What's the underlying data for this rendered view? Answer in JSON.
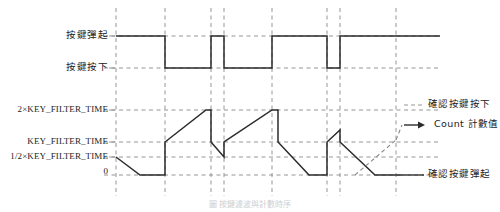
{
  "figure": {
    "caption": "圖 按鍵濾波與計數時序",
    "colors": {
      "waveform": "#2b2b2b",
      "gridline": "#8a8a8a",
      "reference_line": "#8a8a8a",
      "projection_line": "#8a8a8a",
      "background": "#ffffff",
      "text": "#1b1b1b"
    }
  },
  "left_labels": {
    "signal": [
      {
        "id": "key-release",
        "text": "按鍵彈起",
        "y": 36
      },
      {
        "id": "key-press",
        "text": "按鍵按下",
        "y": 68
      }
    ],
    "count_axis": [
      {
        "id": "two-x-key-filter-time",
        "text": "2×KEY_FILTER_TIME",
        "y": 110
      },
      {
        "id": "key-filter-time",
        "text": "KEY_FILTER_TIME",
        "y": 142
      },
      {
        "id": "half-key-filter-time",
        "text": "1/2×KEY_FILTER_TIME",
        "y": 157
      },
      {
        "id": "zero",
        "text": "0",
        "y": 172
      }
    ]
  },
  "right_labels": [
    {
      "id": "confirm-key-press",
      "text": "確認按鍵按下",
      "y": 105
    },
    {
      "id": "count-value",
      "text": "Count 計數值",
      "y": 125,
      "arrow": true
    },
    {
      "id": "confirm-key-release",
      "text": "確認按鍵彈起",
      "y": 175
    }
  ],
  "chart_data": {
    "type": "line",
    "xlabel": "",
    "ylabel": "",
    "grid": true,
    "legend_position": "right",
    "plot_area": {
      "x0": 116,
      "x1": 440,
      "y_top": 8,
      "y_bottom": 196
    },
    "gridlines_x": [
      116,
      165,
      211,
      224,
      272,
      327,
      340,
      396
    ],
    "reference_levels": {
      "key_release": 36,
      "key_press": 68,
      "two_x_key_filter_time": 110,
      "key_filter_time": 142,
      "half_key_filter_time": 157,
      "zero": 175
    },
    "series": [
      {
        "name": "按鍵輸入訊號",
        "kind": "digital",
        "high_label": "按鍵彈起",
        "low_label": "按鍵按下",
        "points": [
          [
            116,
            36
          ],
          [
            165,
            36
          ],
          [
            165,
            68
          ],
          [
            211,
            68
          ],
          [
            211,
            36
          ],
          [
            224,
            36
          ],
          [
            224,
            68
          ],
          [
            272,
            68
          ],
          [
            272,
            36
          ],
          [
            327,
            36
          ],
          [
            327,
            68
          ],
          [
            340,
            68
          ],
          [
            340,
            36
          ],
          [
            440,
            36
          ]
        ]
      },
      {
        "name": "Count 計數值",
        "kind": "analog",
        "points": [
          [
            116,
            157
          ],
          [
            140,
            175
          ],
          [
            165,
            175
          ],
          [
            165,
            142
          ],
          [
            206,
            110
          ],
          [
            211,
            110
          ],
          [
            211,
            142
          ],
          [
            224,
            157
          ],
          [
            224,
            142
          ],
          [
            272,
            110
          ],
          [
            278,
            110
          ],
          [
            278,
            142
          ],
          [
            309,
            175
          ],
          [
            327,
            175
          ],
          [
            327,
            142
          ],
          [
            340,
            130
          ],
          [
            340,
            142
          ],
          [
            375,
            175
          ],
          [
            424,
            175
          ]
        ]
      }
    ],
    "projection": {
      "name": "count-projection-dashed",
      "points": [
        [
          355,
          175
        ],
        [
          396,
          140
        ]
      ],
      "arrow_to": [
        420,
        125
      ]
    }
  }
}
